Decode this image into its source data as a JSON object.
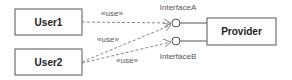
{
  "diagram": {
    "classes": [
      {
        "id": "user1",
        "label": "User1"
      },
      {
        "id": "user2",
        "label": "User2"
      },
      {
        "id": "provider",
        "label": "Provider"
      }
    ],
    "interfaces": [
      {
        "id": "interfaceA",
        "label": "InterfaceA"
      },
      {
        "id": "interfaceB",
        "label": "InterfaceB"
      }
    ],
    "dependencies": [
      {
        "from": "User1",
        "to": "InterfaceA",
        "stereotype": "«use»"
      },
      {
        "from": "User2",
        "to": "InterfaceA",
        "stereotype": "«use»"
      },
      {
        "from": "User2",
        "to": "InterfaceB",
        "stereotype": "«use»"
      }
    ]
  }
}
